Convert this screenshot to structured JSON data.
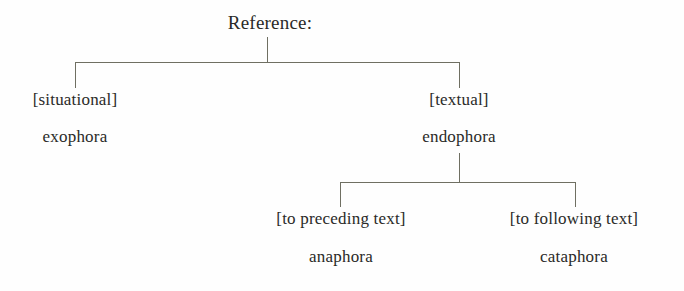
{
  "diagram": {
    "title": "Reference:",
    "type": "tree",
    "nodes": {
      "root": {
        "label": "Reference:"
      },
      "situational": {
        "bracket": "[situational]",
        "term": "exophora"
      },
      "textual": {
        "bracket": "[textual]",
        "term": "endophora"
      },
      "preceding": {
        "bracket": "[to preceding text]",
        "term": "anaphora"
      },
      "following": {
        "bracket": "[to following text]",
        "term": "cataphora"
      }
    },
    "colors": {
      "line": "#6f6f62",
      "text": "#2a2a28",
      "background": "#fefefe"
    }
  }
}
